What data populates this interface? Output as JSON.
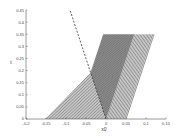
{
  "chart_data": {
    "type": "line",
    "title": "",
    "xlabel": "x0",
    "ylabel": "t",
    "xlim": [
      -0.2,
      0.15
    ],
    "ylim": [
      0,
      0.45
    ],
    "xticks": [
      -0.2,
      -0.15,
      -0.1,
      -0.05,
      0,
      0.05,
      0.1,
      0.15
    ],
    "xtick_labels": [
      "-0.2",
      "-0.15",
      "-0.1",
      "-0.05",
      "0",
      "0.05",
      "0.1",
      "0.15"
    ],
    "yticks": [
      0,
      0.05,
      0.1,
      0.15,
      0.2,
      0.25,
      0.3,
      0.35,
      0.4,
      0.45
    ],
    "ytick_labels": [
      "0",
      "0.05",
      "0.1",
      "0.15",
      "0.2",
      "0.25",
      "0.3",
      "0.35",
      "0.4",
      "0.45"
    ],
    "grid": false,
    "series": [
      {
        "name": "characteristics",
        "style": "solid",
        "color": "#222222",
        "x0_range": [
          -0.15,
          0.05
        ],
        "count": 56,
        "t_end": 0.35,
        "slope_before_kink": 0.59,
        "slope_after_kink": 0.2,
        "kink_locus": "dashed line x = -0.2 t"
      },
      {
        "name": "kink locus",
        "style": "dashed",
        "color": "#333333",
        "x": [
          0,
          -0.09
        ],
        "t": [
          0,
          0.45
        ]
      }
    ]
  }
}
